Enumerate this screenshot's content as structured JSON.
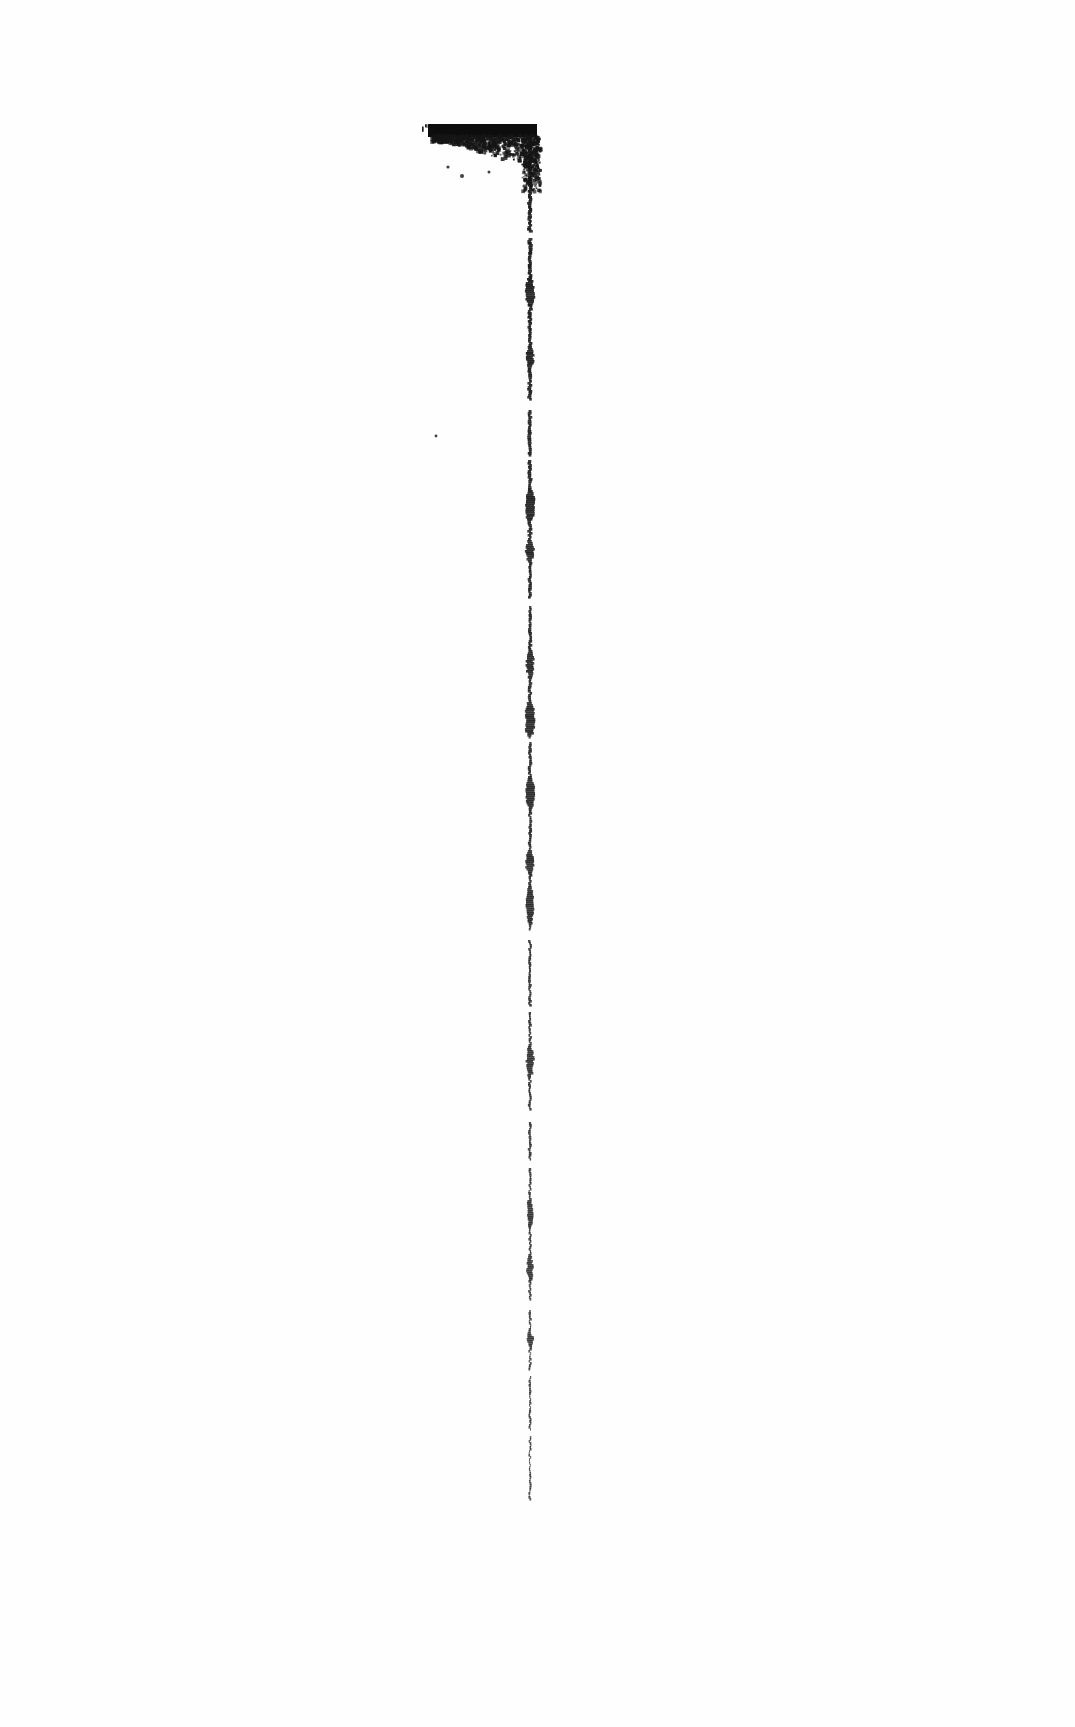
{
  "document": {
    "kind": "scanned-page",
    "page_label": "",
    "visible_text": "",
    "background_color": "#fefefe",
    "ink_color": "#111111",
    "width": 1075,
    "height": 1727
  },
  "artifacts": {
    "description": "Degraded photocopy artifact: an inverted-L shaped black mark formed by a ragged horizontal bar at the top joined to a long broken vertical rule.",
    "horizontal_bar": {
      "name": "top-horizontal-bar",
      "x_start": 428,
      "x_end": 537,
      "y_top": 124,
      "y_bottom": 137,
      "ink_color": "#0d0d0d",
      "edge": "ragged-bleed-below"
    },
    "bleed_cloud": {
      "name": "ink-bleed-cloud",
      "x_start": 430,
      "x_end": 537,
      "y_top": 134,
      "y_bottom": 178,
      "ink_color": "#161616"
    },
    "vertical_rule": {
      "name": "vertical-rule",
      "x": 530,
      "y_top": 124,
      "y_bottom": 1500,
      "ink_color": "#1a1a1a",
      "thickness_min": 1,
      "thickness_max": 9
    },
    "specks": [
      {
        "name": "speck",
        "x": 436,
        "y": 436,
        "r": 1.4
      },
      {
        "name": "speck",
        "x": 462,
        "y": 176,
        "r": 2.0
      },
      {
        "name": "speck",
        "x": 448,
        "y": 167,
        "r": 1.6
      },
      {
        "name": "speck",
        "x": 489,
        "y": 172,
        "r": 1.5
      },
      {
        "name": "speck",
        "x": 432,
        "y": 130,
        "r": 1.8
      }
    ],
    "blobs": [
      {
        "name": "ink-blob",
        "y": 276,
        "h": 30,
        "w": 7
      },
      {
        "name": "ink-blob",
        "y": 345,
        "h": 22,
        "w": 5
      },
      {
        "name": "ink-blob",
        "y": 487,
        "h": 34,
        "w": 9
      },
      {
        "name": "ink-blob",
        "y": 538,
        "h": 24,
        "w": 6
      },
      {
        "name": "ink-blob",
        "y": 648,
        "h": 30,
        "w": 6
      },
      {
        "name": "ink-blob",
        "y": 700,
        "h": 36,
        "w": 10
      },
      {
        "name": "ink-blob",
        "y": 775,
        "h": 34,
        "w": 8
      },
      {
        "name": "ink-blob",
        "y": 848,
        "h": 26,
        "w": 7
      },
      {
        "name": "ink-blob",
        "y": 882,
        "h": 44,
        "w": 6
      },
      {
        "name": "ink-blob",
        "y": 1043,
        "h": 34,
        "w": 6
      },
      {
        "name": "ink-blob",
        "y": 1196,
        "h": 32,
        "w": 5
      },
      {
        "name": "ink-blob",
        "y": 1252,
        "h": 30,
        "w": 5
      },
      {
        "name": "ink-blob",
        "y": 1331,
        "h": 14,
        "w": 6
      }
    ],
    "gaps": [
      {
        "name": "rule-gap",
        "y": 232,
        "h": 6
      },
      {
        "name": "rule-gap",
        "y": 400,
        "h": 9
      },
      {
        "name": "rule-gap",
        "y": 455,
        "h": 5
      },
      {
        "name": "rule-gap",
        "y": 598,
        "h": 8
      },
      {
        "name": "rule-gap",
        "y": 737,
        "h": 5
      },
      {
        "name": "rule-gap",
        "y": 930,
        "h": 10
      },
      {
        "name": "rule-gap",
        "y": 1005,
        "h": 6
      },
      {
        "name": "rule-gap",
        "y": 1110,
        "h": 12
      },
      {
        "name": "rule-gap",
        "y": 1160,
        "h": 7
      },
      {
        "name": "rule-gap",
        "y": 1300,
        "h": 9
      },
      {
        "name": "rule-gap",
        "y": 1370,
        "h": 6
      },
      {
        "name": "rule-gap",
        "y": 1430,
        "h": 5
      }
    ]
  }
}
